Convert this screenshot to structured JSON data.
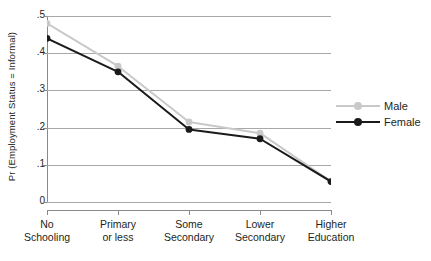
{
  "chart_data": {
    "type": "line",
    "title": "",
    "xlabel": "",
    "ylabel": "Pr (Employment Status = Informal)",
    "categories": [
      "No Schooling",
      "Primary or less",
      "Some Secondary",
      "Lower Secondary",
      "Higher Education"
    ],
    "category_lines": [
      [
        "No",
        "Schooling"
      ],
      [
        "Primary",
        "or less"
      ],
      [
        "Some",
        "Secondary"
      ],
      [
        "Lower",
        "Secondary"
      ],
      [
        "Higher",
        "Education"
      ]
    ],
    "series": [
      {
        "name": "Male",
        "values": [
          0.48,
          0.365,
          0.215,
          0.185,
          0.055
        ],
        "color": "#c9c9c9"
      },
      {
        "name": "Female",
        "values": [
          0.44,
          0.35,
          0.195,
          0.17,
          0.055
        ],
        "color": "#1a1a1a"
      }
    ],
    "ylim": [
      0,
      0.5
    ],
    "yticks": [
      0,
      0.1,
      0.2,
      0.3,
      0.4,
      0.5
    ],
    "ytick_labels": [
      "0",
      ".1",
      ".2",
      ".3",
      ".4",
      ".5"
    ],
    "grid": true,
    "grid_color": "#a8a8a8",
    "legend_position": "right",
    "legend_entries": [
      "Male",
      "Female"
    ],
    "axis_color": "#8a8a8a",
    "background": "#ffffff"
  }
}
